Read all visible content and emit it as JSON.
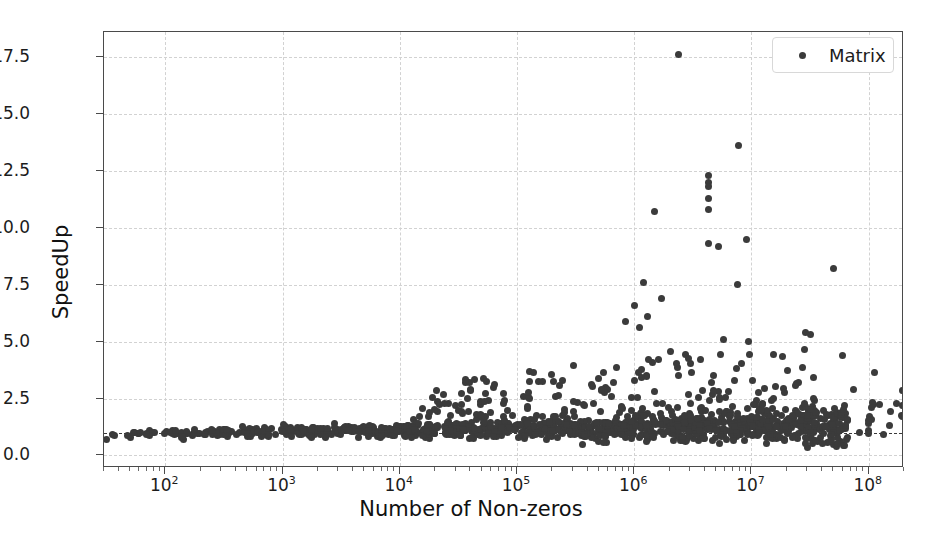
{
  "chart": {
    "type": "scatter",
    "title": "",
    "xlabel": "Number of Non-zeros",
    "ylabel": "SpeedUp",
    "legend": {
      "position": "upper-right",
      "entries": [
        {
          "label": "Matrix",
          "marker": "circle",
          "color": "#3b3b3b"
        }
      ]
    },
    "xscale": "log",
    "yscale": "linear",
    "xlim": [
      30,
      200000000
    ],
    "ylim": [
      -0.55,
      18.6
    ],
    "grid": true,
    "grid_color": "#d2d2d2",
    "grid_style": "dashed",
    "reference_line": {
      "y": 1.0,
      "style": "dashed",
      "color": "#3a3a3a"
    },
    "marker_color": "#3b3b3b",
    "marker_size_px": 7,
    "frame_color": "#4a4a4a",
    "background": "#ffffff",
    "xticks": [
      {
        "value": 100,
        "label": "10",
        "exp": "2"
      },
      {
        "value": 1000,
        "label": "10",
        "exp": "3"
      },
      {
        "value": 10000,
        "label": "10",
        "exp": "4"
      },
      {
        "value": 100000,
        "label": "10",
        "exp": "5"
      },
      {
        "value": 1000000,
        "label": "10",
        "exp": "6"
      },
      {
        "value": 10000000,
        "label": "10",
        "exp": "7"
      },
      {
        "value": 100000000,
        "label": "10",
        "exp": "8"
      }
    ],
    "yticks": [
      {
        "value": 0.0,
        "label": "0.0"
      },
      {
        "value": 2.5,
        "label": "2.5"
      },
      {
        "value": 5.0,
        "label": "5.0"
      },
      {
        "value": 7.5,
        "label": "7.5"
      },
      {
        "value": 10.0,
        "label": "10.0"
      },
      {
        "value": 12.5,
        "label": "12.5"
      },
      {
        "value": 15.0,
        "label": "15.0"
      },
      {
        "value": 17.5,
        "label": "17.5"
      }
    ],
    "series": [
      {
        "name": "Matrix",
        "summary": {
          "n_points": 1100,
          "median_speedup": 1.05,
          "max_speedup": 17.6,
          "max_speedup_nnz": 2400000,
          "min_speedup": 0.3,
          "trend": "speedup spread widens with increasing number of non-zeros; dense band near 1.0 for nnz below 1e5, outliers up to 17.6 between 1e6 and 1e7"
        },
        "outliers": [
          {
            "nnz": 2400000,
            "speedup": 17.6
          },
          {
            "nnz": 7800000,
            "speedup": 13.6
          },
          {
            "nnz": 4300000,
            "speedup": 12.3
          },
          {
            "nnz": 4300000,
            "speedup": 12.0
          },
          {
            "nnz": 4300000,
            "speedup": 11.8
          },
          {
            "nnz": 4300000,
            "speedup": 11.3
          },
          {
            "nnz": 4300000,
            "speedup": 10.8
          },
          {
            "nnz": 1500000,
            "speedup": 10.7
          },
          {
            "nnz": 9000000,
            "speedup": 9.5
          },
          {
            "nnz": 4300000,
            "speedup": 9.3
          },
          {
            "nnz": 5200000,
            "speedup": 9.2
          },
          {
            "nnz": 50000000,
            "speedup": 8.2
          },
          {
            "nnz": 1200000,
            "speedup": 7.6
          },
          {
            "nnz": 7600000,
            "speedup": 7.5
          },
          {
            "nnz": 1700000,
            "speedup": 6.9
          },
          {
            "nnz": 1000000,
            "speedup": 6.6
          },
          {
            "nnz": 1300000,
            "speedup": 6.1
          },
          {
            "nnz": 850000,
            "speedup": 5.9
          },
          {
            "nnz": 1100000,
            "speedup": 5.6
          },
          {
            "nnz": 5800000,
            "speedup": 5.1
          },
          {
            "nnz": 9500000,
            "speedup": 5.0
          },
          {
            "nnz": 60000000,
            "speedup": 4.4
          }
        ]
      }
    ]
  }
}
